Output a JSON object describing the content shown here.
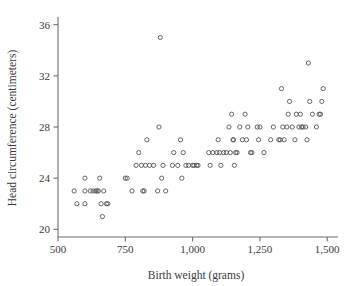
{
  "chart_data": {
    "type": "scatter",
    "title": "",
    "xlabel": "Birth weight (grams)",
    "ylabel": "Head circumference (centimeters)",
    "xlim": [
      500,
      1540
    ],
    "ylim": [
      19.4,
      36.6
    ],
    "xticks": [
      500,
      750,
      1000,
      1250,
      1500
    ],
    "xtick_labels": [
      "500",
      "750",
      "1,000",
      "1,250",
      "1,500"
    ],
    "yticks": [
      20,
      24,
      28,
      32,
      36
    ],
    "ytick_labels": [
      "20",
      "24",
      "28",
      "32",
      "36"
    ],
    "grid": false,
    "legend": null,
    "marker": "open-circle",
    "marker_color": "#53535a",
    "axis_color": "#6e6e6e",
    "background": "#ffffff",
    "n_points": 100,
    "points": [
      [
        560,
        23
      ],
      [
        570,
        22
      ],
      [
        600,
        24
      ],
      [
        600,
        23
      ],
      [
        600,
        22
      ],
      [
        620,
        23
      ],
      [
        630,
        23
      ],
      [
        640,
        23
      ],
      [
        645,
        23
      ],
      [
        650,
        23
      ],
      [
        655,
        24
      ],
      [
        660,
        22
      ],
      [
        665,
        21
      ],
      [
        670,
        23
      ],
      [
        680,
        22
      ],
      [
        685,
        22
      ],
      [
        750,
        24
      ],
      [
        757,
        24
      ],
      [
        775,
        23
      ],
      [
        790,
        25
      ],
      [
        800,
        26
      ],
      [
        810,
        25
      ],
      [
        815,
        23
      ],
      [
        820,
        23
      ],
      [
        825,
        25
      ],
      [
        830,
        27
      ],
      [
        840,
        25
      ],
      [
        855,
        25
      ],
      [
        870,
        23
      ],
      [
        875,
        28
      ],
      [
        880,
        35
      ],
      [
        885,
        24
      ],
      [
        890,
        25
      ],
      [
        900,
        23
      ],
      [
        925,
        25
      ],
      [
        930,
        26
      ],
      [
        945,
        25
      ],
      [
        955,
        27
      ],
      [
        960,
        24
      ],
      [
        965,
        26
      ],
      [
        975,
        25
      ],
      [
        985,
        25
      ],
      [
        1000,
        25
      ],
      [
        1005,
        25
      ],
      [
        1015,
        25
      ],
      [
        1020,
        25
      ],
      [
        1060,
        26
      ],
      [
        1065,
        25
      ],
      [
        1075,
        26
      ],
      [
        1090,
        26
      ],
      [
        1095,
        27
      ],
      [
        1100,
        26
      ],
      [
        1105,
        25
      ],
      [
        1115,
        26
      ],
      [
        1125,
        26
      ],
      [
        1135,
        28
      ],
      [
        1140,
        26
      ],
      [
        1145,
        29
      ],
      [
        1150,
        27
      ],
      [
        1152,
        27
      ],
      [
        1155,
        25
      ],
      [
        1160,
        26
      ],
      [
        1165,
        26
      ],
      [
        1175,
        28
      ],
      [
        1185,
        27
      ],
      [
        1195,
        29
      ],
      [
        1200,
        27
      ],
      [
        1205,
        28
      ],
      [
        1215,
        26
      ],
      [
        1220,
        26
      ],
      [
        1240,
        28
      ],
      [
        1245,
        27
      ],
      [
        1250,
        28
      ],
      [
        1265,
        26
      ],
      [
        1290,
        27
      ],
      [
        1300,
        28
      ],
      [
        1320,
        27
      ],
      [
        1325,
        27
      ],
      [
        1330,
        31
      ],
      [
        1335,
        28
      ],
      [
        1340,
        27
      ],
      [
        1350,
        28
      ],
      [
        1355,
        29
      ],
      [
        1360,
        30
      ],
      [
        1370,
        28
      ],
      [
        1380,
        27
      ],
      [
        1385,
        29
      ],
      [
        1395,
        28
      ],
      [
        1400,
        29
      ],
      [
        1405,
        28
      ],
      [
        1410,
        28
      ],
      [
        1420,
        28
      ],
      [
        1425,
        27
      ],
      [
        1430,
        33
      ],
      [
        1435,
        30
      ],
      [
        1445,
        29
      ],
      [
        1460,
        28
      ],
      [
        1470,
        29
      ],
      [
        1475,
        29
      ],
      [
        1480,
        30
      ],
      [
        1485,
        31
      ]
    ]
  },
  "figure": {
    "x_axis_name": "birth-weight-axis",
    "y_axis_name": "head-circumference-axis"
  }
}
